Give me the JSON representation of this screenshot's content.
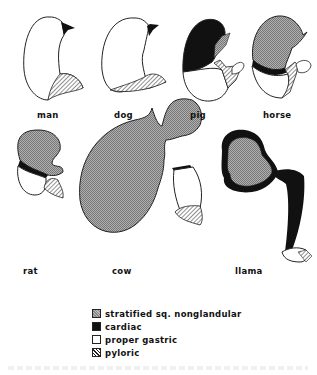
{
  "figure": {
    "species": [
      {
        "id": "man",
        "label": "man"
      },
      {
        "id": "dog",
        "label": "dog"
      },
      {
        "id": "pig",
        "label": "pig"
      },
      {
        "id": "horse",
        "label": "horse"
      },
      {
        "id": "rat",
        "label": "rat"
      },
      {
        "id": "cow",
        "label": "cow"
      },
      {
        "id": "llama",
        "label": "llama"
      }
    ],
    "legend": [
      {
        "id": "stratified",
        "label": "stratified sq. nonglandular",
        "pattern": "crosshatch-gray"
      },
      {
        "id": "cardiac",
        "label": "cardiac",
        "pattern": "solid-black"
      },
      {
        "id": "proper",
        "label": "proper gastric",
        "pattern": "white"
      },
      {
        "id": "pyloric",
        "label": "pyloric",
        "pattern": "diagonal-hatch"
      }
    ]
  },
  "colors": {
    "stratified": "#9a9a9a",
    "cardiac": "#111111",
    "proper": "#ffffff",
    "outline": "#222222"
  }
}
